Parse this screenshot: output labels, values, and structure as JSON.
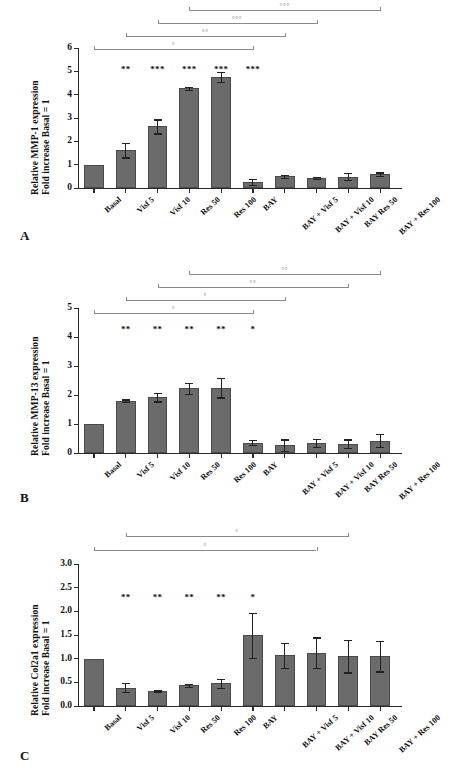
{
  "figure": {
    "bar_color": "#6b6b6b",
    "axis_color": "#2a2a2a",
    "bracket_color": "#8a8a8a"
  },
  "categories": [
    "Basal",
    "Visf 5",
    "Visf 10",
    "Res 50",
    "Res 100",
    "BAY",
    "BAY + Visf 5",
    "BAY + Visf 10",
    "BAY Res 50",
    "BAY + Res 100"
  ],
  "panels": [
    {
      "letter": "A",
      "ylabel_line1": "Relative MMP-1 expression",
      "ylabel_line2": "Fold increase Basal = 1",
      "ticks": [
        "0",
        "1",
        "2",
        "3",
        "4",
        "5",
        "6"
      ],
      "significance": [
        "",
        "**",
        "***",
        "***",
        "***",
        "***",
        "",
        "",
        "",
        ""
      ],
      "brackets": [
        {
          "mark": "°"
        },
        {
          "mark": "°°"
        },
        {
          "mark": "°°°"
        },
        {
          "mark": "°°°"
        }
      ]
    },
    {
      "letter": "B",
      "ylabel_line1": "Relative MMP-13 expression",
      "ylabel_line2": "Fold increase Basal = 1",
      "ticks": [
        "0",
        "1",
        "2",
        "3",
        "4",
        "5"
      ],
      "significance": [
        "",
        "**",
        "**",
        "**",
        "**",
        "*",
        "",
        "",
        "",
        ""
      ],
      "brackets": [
        {
          "mark": "°"
        },
        {
          "mark": "°"
        },
        {
          "mark": "°°"
        },
        {
          "mark": "°°"
        }
      ]
    },
    {
      "letter": "C",
      "ylabel_line1": "Relative Col2a1 expression",
      "ylabel_line2": "Fold increase Basal = 1",
      "ticks": [
        "0.0",
        "0.5",
        "1.0",
        "1.5",
        "2.0",
        "2.5",
        "3.0"
      ],
      "significance": [
        "",
        "**",
        "**",
        "**",
        "**",
        "*",
        "",
        "",
        "",
        ""
      ],
      "brackets": [
        {
          "mark": "°"
        },
        {
          "mark": "°"
        }
      ]
    }
  ],
  "chart_data": [
    {
      "type": "bar",
      "title": "A",
      "xlabel": "",
      "ylabel": "Relative MMP-1 expression Fold increase Basal = 1",
      "ylim": [
        0,
        6
      ],
      "yticks": [
        0,
        1,
        2,
        3,
        4,
        5,
        6
      ],
      "grid": false,
      "legend": "none",
      "categories": [
        "Basal",
        "Visf 5",
        "Visf 10",
        "Res 50",
        "Res 100",
        "BAY",
        "BAY + Visf 5",
        "BAY + Visf 10",
        "BAY Res 50",
        "BAY + Res 100"
      ],
      "values": [
        1.0,
        1.63,
        2.64,
        4.28,
        4.76,
        0.27,
        0.5,
        0.44,
        0.48,
        0.59
      ],
      "errors": [
        0.0,
        0.32,
        0.3,
        0.06,
        0.22,
        0.13,
        0.07,
        0.05,
        0.15,
        0.08
      ],
      "annotations": [
        "",
        "**",
        "***",
        "***",
        "***",
        "***",
        "",
        "",
        "",
        ""
      ]
    },
    {
      "type": "bar",
      "title": "B",
      "xlabel": "",
      "ylabel": "Relative MMP-13 expression Fold increase Basal = 1",
      "ylim": [
        0,
        5
      ],
      "yticks": [
        0,
        1,
        2,
        3,
        4,
        5
      ],
      "grid": false,
      "legend": "none",
      "categories": [
        "Basal",
        "Visf 5",
        "Visf 10",
        "Res 50",
        "Res 100",
        "BAY",
        "BAY + Visf 5",
        "BAY + Visf 10",
        "BAY Res 50",
        "BAY + Res 100"
      ],
      "values": [
        1.0,
        1.8,
        1.92,
        2.23,
        2.25,
        0.36,
        0.27,
        0.34,
        0.32,
        0.43
      ],
      "errors": [
        0.0,
        0.05,
        0.14,
        0.18,
        0.33,
        0.08,
        0.2,
        0.14,
        0.15,
        0.23
      ],
      "annotations": [
        "",
        "**",
        "**",
        "**",
        "**",
        "*",
        "",
        "",
        "",
        ""
      ]
    },
    {
      "type": "bar",
      "title": "C",
      "xlabel": "",
      "ylabel": "Relative Col2a1 expression Fold increase Basal = 1",
      "ylim": [
        0,
        3.0
      ],
      "yticks": [
        0.0,
        0.5,
        1.0,
        1.5,
        2.0,
        2.5,
        3.0
      ],
      "grid": false,
      "legend": "none",
      "categories": [
        "Basal",
        "Visf 5",
        "Visf 10",
        "Res 50",
        "Res 100",
        "BAY",
        "BAY + Visf 5",
        "BAY + Visf 10",
        "BAY Res 50",
        "BAY + Res 100"
      ],
      "values": [
        1.0,
        0.39,
        0.31,
        0.44,
        0.48,
        1.49,
        1.07,
        1.13,
        1.05,
        1.05
      ],
      "errors": [
        0.0,
        0.09,
        0.02,
        0.03,
        0.09,
        0.48,
        0.27,
        0.32,
        0.34,
        0.32
      ],
      "annotations": [
        "",
        "**",
        "**",
        "**",
        "**",
        "*",
        "",
        "",
        "",
        ""
      ]
    }
  ]
}
